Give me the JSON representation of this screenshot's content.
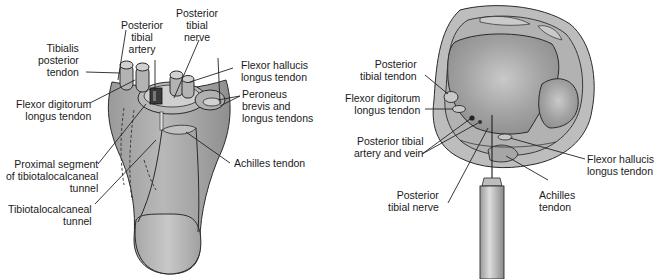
{
  "figure": {
    "panels": [
      {
        "id": "left",
        "description": "Posterior view of ankle showing tibiotalocalcaneal tunnel",
        "labels": [
          {
            "key": "tibialis_posterior_tendon",
            "text": "Tibialis\nposterior\ntendon"
          },
          {
            "key": "posterior_tibial_artery",
            "text": "Posterior\ntibial\nartery"
          },
          {
            "key": "posterior_tibial_nerve",
            "text": "Posterior\ntibial\nnerve"
          },
          {
            "key": "flexor_hallucis_longus_tendon",
            "text": "Flexor hallucis\nlongus tendon"
          },
          {
            "key": "flexor_digitorum_longus_tendon",
            "text": "Flexor digitorum\nlongus tendon"
          },
          {
            "key": "peroneus_tendons",
            "text": "Peroneus\nbrevis and\nlongus tendons"
          },
          {
            "key": "proximal_segment",
            "text": "Proximal segment\nof tibiotalocalcaneal\ntunnel"
          },
          {
            "key": "achilles_tendon",
            "text": "Achilles tendon"
          },
          {
            "key": "tibiotalocalcaneal_tunnel",
            "text": "Tibiotalocalcaneal\ntunnel"
          }
        ]
      },
      {
        "id": "right",
        "description": "Axial cross-section of ankle with needle approach",
        "labels": [
          {
            "key": "posterior_tibial_tendon",
            "text": "Posterior\ntibial tendon"
          },
          {
            "key": "flexor_digitorum_longus_tendon",
            "text": "Flexor digitorum\nlongus tendon"
          },
          {
            "key": "posterior_tibial_artery_vein",
            "text": "Posterior tibial\nartery and vein"
          },
          {
            "key": "flexor_hallucis_longus_tendon",
            "text": "Flexor hallucis\nlongus tendon"
          },
          {
            "key": "posterior_tibial_nerve",
            "text": "Posterior\ntibial nerve"
          },
          {
            "key": "achilles_tendon",
            "text": "Achilles\ntendon"
          }
        ]
      }
    ],
    "colors": {
      "tissue": "#a9a9a9",
      "tissue_light": "#c4c4c4",
      "bone": "#9c9c9c",
      "outline": "#2a2a2a",
      "background": "#ffffff"
    }
  }
}
